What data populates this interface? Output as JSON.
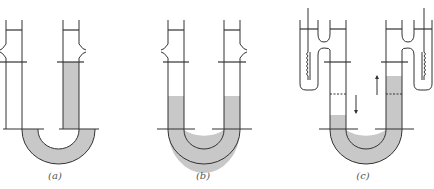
{
  "figure": {
    "colors": {
      "line": "#333333",
      "liquid": "#c8c8c8",
      "background": "#ffffff"
    },
    "panels": [
      {
        "id": "a",
        "label": "(a)",
        "liquid_state": "liquid only in right arm and bend"
      },
      {
        "id": "b",
        "label": "(b)",
        "liquid_state": "equal liquid levels in both arms"
      },
      {
        "id": "c",
        "label": "(c)",
        "liquid_state": "unequal levels with heating coils; arrows show left falling, right rising"
      }
    ]
  }
}
